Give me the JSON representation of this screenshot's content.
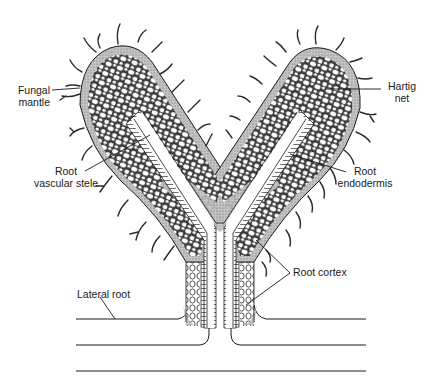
{
  "figure": {
    "type": "labeled biological illustration",
    "colors": {
      "ink": "#1a1a1a",
      "mantle_fill": "#a9a9a9",
      "cell_fill": "#ffffff",
      "background": "#ffffff"
    }
  },
  "labels": {
    "fungal_mantle": {
      "line1": "Fungal",
      "line2": "mantle"
    },
    "hartig_net": {
      "line1": "Hartig",
      "line2": "net"
    },
    "root_vascular_stele": {
      "line1": "Root",
      "line2": "vascular stele"
    },
    "root_endodermis": {
      "line1": "Root",
      "line2": "endodermis"
    },
    "root_cortex": {
      "text": "Root cortex"
    },
    "lateral_root": {
      "text": "Lateral root"
    }
  }
}
